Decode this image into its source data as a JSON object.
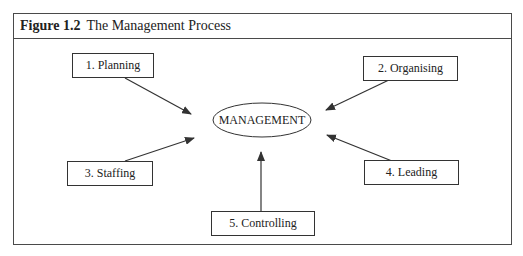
{
  "figure": {
    "label": "Figure 1.2",
    "title": "The Management Process"
  },
  "center": {
    "label": "MANAGEMENT"
  },
  "nodes": [
    {
      "id": 1,
      "label": "1. Planning"
    },
    {
      "id": 2,
      "label": "2. Organising"
    },
    {
      "id": 3,
      "label": "3. Staffing"
    },
    {
      "id": 4,
      "label": "4. Leading"
    },
    {
      "id": 5,
      "label": "5. Controlling"
    }
  ],
  "colors": {
    "line": "#333333",
    "border": "#4a4a4a",
    "background": "#ffffff"
  }
}
